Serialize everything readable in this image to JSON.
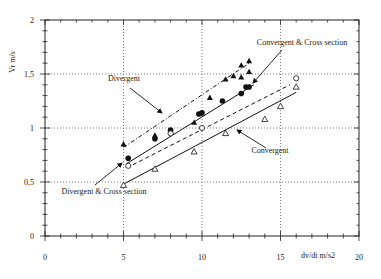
{
  "chart_data": {
    "type": "scatter",
    "title": "",
    "xlabel": "dv/dt m/s2",
    "ylabel": "Vr m/s",
    "xlim": [
      0,
      20
    ],
    "ylim": [
      0,
      2
    ],
    "x_ticks": [
      "0",
      "5",
      "10",
      "15",
      "20"
    ],
    "y_ticks": [
      "0",
      "0,5",
      "1",
      "1,5",
      "2"
    ],
    "grid": true,
    "legend": "none (inline annotations with arrows)",
    "series": [
      {
        "name": "Divergent",
        "marker": "filled-triangle",
        "fit_line": "dash-dot",
        "points": [
          [
            5,
            0.85
          ],
          [
            7,
            0.93
          ],
          [
            8,
            0.97
          ],
          [
            9.5,
            1.05
          ],
          [
            10.5,
            1.28
          ],
          [
            11.5,
            1.45
          ],
          [
            12,
            1.48
          ],
          [
            12.5,
            1.58
          ],
          [
            12.5,
            1.47
          ],
          [
            13,
            1.62
          ],
          [
            13,
            1.52
          ]
        ],
        "fit": [
          [
            5,
            0.82
          ],
          [
            13,
            1.6
          ]
        ]
      },
      {
        "name": "Divergent & Cross section",
        "marker": "filled-circle",
        "fit_line": "solid",
        "points": [
          [
            5.3,
            0.72
          ],
          [
            7,
            0.9
          ],
          [
            8,
            0.98
          ],
          [
            9.8,
            1.13
          ],
          [
            10,
            1.14
          ],
          [
            11.3,
            1.25
          ],
          [
            12.5,
            1.32
          ],
          [
            12.8,
            1.38
          ],
          [
            13,
            1.38
          ]
        ],
        "fit": [
          [
            5.2,
            0.67
          ],
          [
            13.3,
            1.4
          ]
        ]
      },
      {
        "name": "Convergent & Cross section",
        "marker": "open-circle",
        "fit_line": "dashed",
        "points": [
          [
            5.3,
            0.65
          ],
          [
            8,
            0.95
          ],
          [
            10,
            1.0
          ],
          [
            16,
            1.46
          ]
        ],
        "fit": [
          [
            5.6,
            0.66
          ],
          [
            15.6,
            1.4
          ]
        ]
      },
      {
        "name": "Convergent",
        "marker": "open-triangle",
        "fit_line": "solid",
        "points": [
          [
            5,
            0.47
          ],
          [
            7,
            0.62
          ],
          [
            9.5,
            0.78
          ],
          [
            11.5,
            0.95
          ],
          [
            14,
            1.08
          ],
          [
            15,
            1.2
          ],
          [
            16,
            1.38
          ]
        ],
        "fit": [
          [
            5,
            0.48
          ],
          [
            16,
            1.33
          ]
        ]
      }
    ],
    "annotations": [
      {
        "text": "Divergent",
        "x": 9.3,
        "y": 1.27
      },
      {
        "text": "Divergent & Cross section",
        "x": 7.9,
        "y": 0.32
      },
      {
        "text": "Convergent & Cross section",
        "x": 15.5,
        "y": 1.76
      },
      {
        "text": "Convergent",
        "x": 15.7,
        "y": 0.83
      }
    ]
  }
}
